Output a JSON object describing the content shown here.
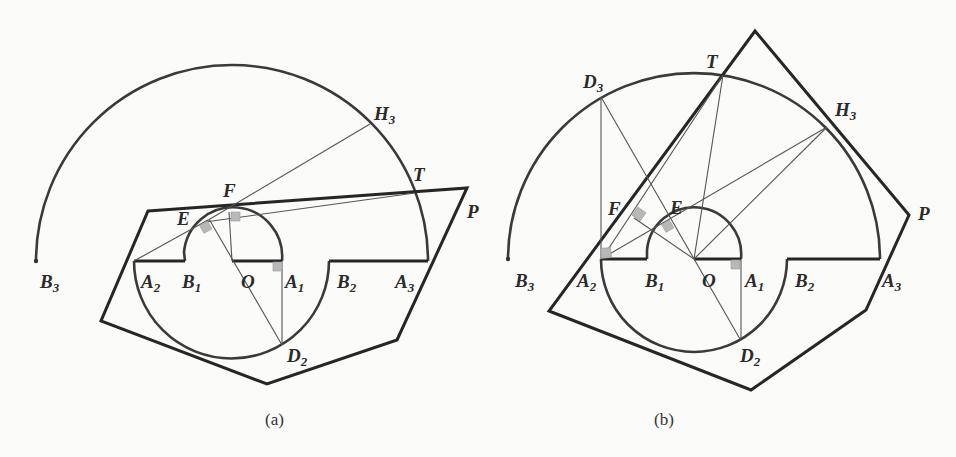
{
  "figure": {
    "panels": [
      {
        "id": "a",
        "caption": "(a)",
        "labels": {
          "B3": {
            "main": "B",
            "sub": "3"
          },
          "A2": {
            "main": "A",
            "sub": "2"
          },
          "B1": {
            "main": "B",
            "sub": "1"
          },
          "O": {
            "main": "O",
            "sub": ""
          },
          "A1": {
            "main": "A",
            "sub": "1"
          },
          "B2": {
            "main": "B",
            "sub": "2"
          },
          "A3": {
            "main": "A",
            "sub": "3"
          },
          "E": {
            "main": "E",
            "sub": ""
          },
          "F": {
            "main": "F",
            "sub": ""
          },
          "H3": {
            "main": "H",
            "sub": "3"
          },
          "T": {
            "main": "T",
            "sub": ""
          },
          "P": {
            "main": "P",
            "sub": ""
          },
          "D2": {
            "main": "D",
            "sub": "2"
          }
        }
      },
      {
        "id": "b",
        "caption": "(b)",
        "labels": {
          "B3": {
            "main": "B",
            "sub": "3"
          },
          "A2": {
            "main": "A",
            "sub": "2"
          },
          "B1": {
            "main": "B",
            "sub": "1"
          },
          "O": {
            "main": "O",
            "sub": ""
          },
          "A1": {
            "main": "A",
            "sub": "1"
          },
          "B2": {
            "main": "B",
            "sub": "2"
          },
          "A3": {
            "main": "A",
            "sub": "3"
          },
          "D3": {
            "main": "D",
            "sub": "3"
          },
          "T": {
            "main": "T",
            "sub": ""
          },
          "H3": {
            "main": "H",
            "sub": "3"
          },
          "P": {
            "main": "P",
            "sub": ""
          },
          "F": {
            "main": "F",
            "sub": ""
          },
          "E": {
            "main": "E",
            "sub": ""
          },
          "D2": {
            "main": "D",
            "sub": "2"
          }
        }
      }
    ]
  },
  "colors": {
    "background": "#fbfbfa",
    "stroke": "#262626",
    "right_angle_marker": "#b8b8b8"
  }
}
